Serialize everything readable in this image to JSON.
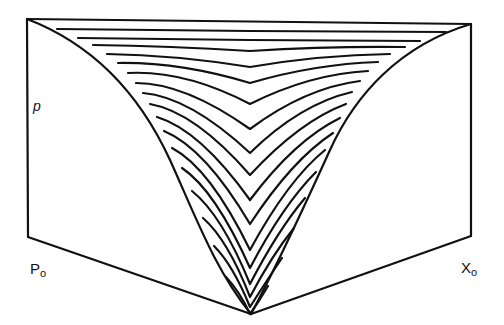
{
  "diagram": {
    "type": "3d surface contour sketch",
    "labels": {
      "p": "p",
      "p0_main": "P",
      "p0_sub": "o",
      "x0_main": "X",
      "x0_sub": "o"
    },
    "colors": {
      "stroke": "#111111",
      "background": "#ffffff"
    },
    "contour_count": 17
  }
}
